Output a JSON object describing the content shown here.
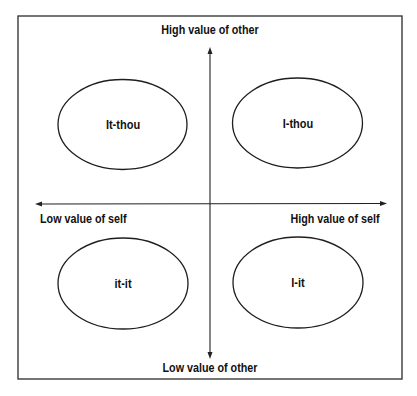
{
  "diagram": {
    "type": "quadrant-diagram",
    "axes": {
      "vertical": {
        "top_label": "High value of other",
        "bottom_label": "Low value of other"
      },
      "horizontal": {
        "left_label": "Low value of self",
        "right_label": "High value of self"
      }
    },
    "quadrants": [
      {
        "position": "top-left",
        "label": "It-thou"
      },
      {
        "position": "top-right",
        "label": "I-thou"
      },
      {
        "position": "bottom-left",
        "label": "it-it"
      },
      {
        "position": "bottom-right",
        "label": "I-it"
      }
    ],
    "colors": {
      "line": "#222222",
      "frame": "#3a3a3a",
      "text": "#111111",
      "background": "#ffffff"
    }
  }
}
